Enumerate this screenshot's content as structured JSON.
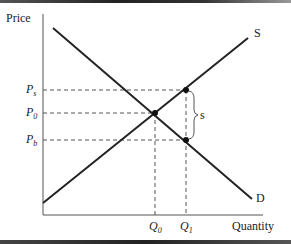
{
  "diagram": {
    "y_axis_label": "Price",
    "x_axis_label": "Quantity",
    "curves": [
      {
        "name": "S",
        "label": "S",
        "from": [
          43,
          203
        ],
        "to": [
          248,
          38
        ]
      },
      {
        "name": "D",
        "label": "D",
        "from": [
          53,
          28
        ],
        "to": [
          252,
          199
        ]
      }
    ],
    "price_labels": {
      "ps": {
        "main": "P",
        "sub": "s"
      },
      "p0": {
        "main": "P",
        "sub": "0"
      },
      "pb": {
        "main": "P",
        "sub": "b"
      }
    },
    "quantity_labels": {
      "q0": {
        "main": "Q",
        "sub": "0"
      },
      "q1": {
        "main": "Q",
        "sub": "1"
      }
    },
    "subsidy_label": "s",
    "points": {
      "equilibrium": [
        155,
        113
      ],
      "seller_price_point": [
        186,
        90
      ],
      "buyer_price_point": [
        186,
        140
      ]
    }
  },
  "colors": {
    "line": "#222222",
    "dash": "#555555",
    "background": "#ffffff"
  }
}
